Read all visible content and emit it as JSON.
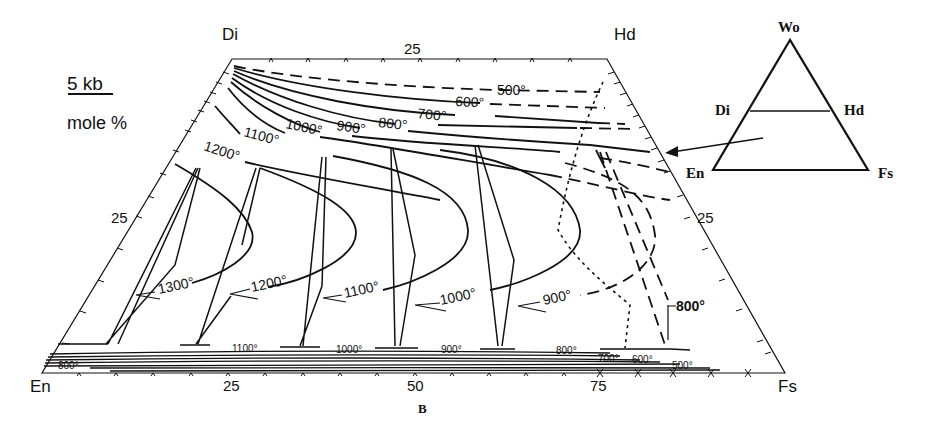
{
  "diagram": {
    "pressure_label": "5 kb",
    "units_label": "mole %",
    "caption": "B",
    "corners": {
      "top_left": "Di",
      "top_right": "Hd",
      "bottom_left": "En",
      "bottom_right": "Fs"
    },
    "axis_ticks": {
      "top": "25",
      "left": "25",
      "right": "25",
      "bottom": [
        "25",
        "50",
        "75"
      ]
    },
    "upper_isotherms": [
      "500°",
      "600°",
      "700°",
      "800°",
      "900°",
      "1000°",
      "1100°",
      "1200°"
    ],
    "solvus_loops": [
      "1300°",
      "1200°",
      "1100°",
      "1000°",
      "900°",
      "800°"
    ],
    "lower_isotherms": [
      "800°",
      "1100°",
      "1000°",
      "900°",
      "800°",
      "700°",
      "600°",
      "500°"
    ],
    "inset": {
      "apex": "Wo",
      "left_mid": "Di",
      "right_mid": "Hd",
      "bottom_left": "En",
      "bottom_right": "Fs"
    }
  }
}
